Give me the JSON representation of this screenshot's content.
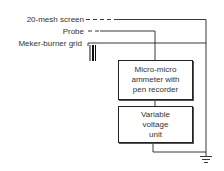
{
  "diagram": {
    "labels": {
      "screen": "20-mesh screen",
      "probe": "Probe",
      "grid": "Meker-burner grid"
    },
    "boxes": {
      "ammeter": {
        "lines": [
          "Micro-micro",
          "ammeter with",
          "pen recorder"
        ]
      },
      "voltage": {
        "lines": [
          "Variable",
          "voltage",
          "unit"
        ]
      }
    },
    "icons": [
      "burner-grid-icon",
      "ground-icon"
    ],
    "colors": {
      "line": "#222222",
      "text": "#333333",
      "background": "#ffffff"
    }
  }
}
